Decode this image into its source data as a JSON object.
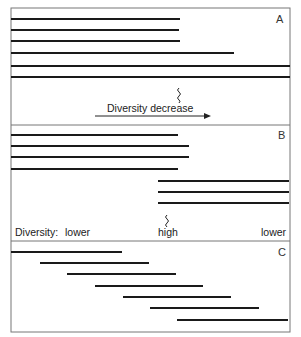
{
  "figure": {
    "frame": {
      "x": 11,
      "y": 8,
      "width": 279,
      "height": 324,
      "stroke": "#777777"
    },
    "line_color": "#1a1a1a",
    "panels": [
      {
        "id": "A",
        "label": "A",
        "top": 8,
        "bottom": 125,
        "ranges": [
          {
            "y": 19,
            "x1": 11,
            "x2": 180
          },
          {
            "y": 30,
            "x1": 11,
            "x2": 179
          },
          {
            "y": 41,
            "x1": 11,
            "x2": 180
          },
          {
            "y": 53,
            "x1": 11,
            "x2": 234
          },
          {
            "y": 66,
            "x1": 11,
            "x2": 290
          },
          {
            "y": 77,
            "x1": 11,
            "x2": 290
          }
        ],
        "annotation": {
          "text": "Diversity decrease",
          "arrow_direction": "right"
        }
      },
      {
        "id": "B",
        "label": "B",
        "top": 125,
        "bottom": 241,
        "ranges": [
          {
            "y": 135,
            "x1": 11,
            "x2": 178
          },
          {
            "y": 146,
            "x1": 11,
            "x2": 189
          },
          {
            "y": 157,
            "x1": 11,
            "x2": 189
          },
          {
            "y": 169,
            "x1": 11,
            "x2": 178
          },
          {
            "y": 181,
            "x1": 158,
            "x2": 289
          },
          {
            "y": 192,
            "x1": 158,
            "x2": 289
          },
          {
            "y": 203,
            "x1": 158,
            "x2": 289
          }
        ],
        "diversity_scale": {
          "label": "Diversity:",
          "left": "lower",
          "middle": "high",
          "right": "lower"
        }
      },
      {
        "id": "C",
        "label": "C",
        "top": 241,
        "bottom": 332,
        "ranges": [
          {
            "y": 252,
            "x1": 11,
            "x2": 122
          },
          {
            "y": 263,
            "x1": 40,
            "x2": 149
          },
          {
            "y": 274,
            "x1": 67,
            "x2": 176
          },
          {
            "y": 286,
            "x1": 95,
            "x2": 203
          },
          {
            "y": 297,
            "x1": 123,
            "x2": 231
          },
          {
            "y": 308,
            "x1": 150,
            "x2": 259
          },
          {
            "y": 320,
            "x1": 177,
            "x2": 288
          }
        ]
      }
    ]
  }
}
